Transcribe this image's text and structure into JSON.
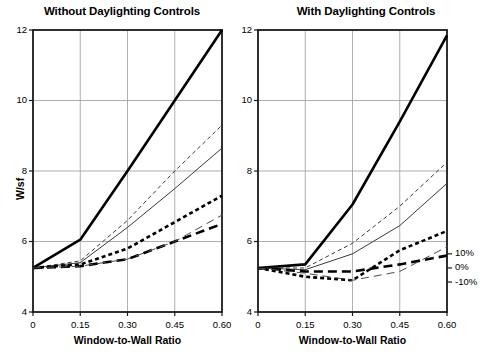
{
  "chart_data": [
    {
      "type": "line",
      "title": "Without Daylighting Controls",
      "xlabel": "Window-to-Wall Ratio",
      "ylabel": "W/sf",
      "xlim": [
        0,
        0.6
      ],
      "ylim": [
        4,
        12
      ],
      "xticks": [
        0,
        0.15,
        0.3,
        0.45,
        0.6
      ],
      "xticklabels": [
        "0",
        "0.15",
        "0.30",
        "0.45",
        "0.60"
      ],
      "yticks": [
        4,
        6,
        8,
        10,
        12
      ],
      "yticklabels": [
        "4",
        "6",
        "8",
        "10",
        "12"
      ],
      "grid": true,
      "legend": null,
      "x": [
        0,
        0.15,
        0.3,
        0.45,
        0.6
      ],
      "series": [
        {
          "name": "thick-solid",
          "style": "solid",
          "width": "thick",
          "color": "#000000",
          "values": [
            5.25,
            6.05,
            8.0,
            10.0,
            12.0
          ]
        },
        {
          "name": "thin-dashed-short",
          "style": "dashed-fine",
          "width": "thin",
          "color": "#3a3a3a",
          "values": [
            5.25,
            5.45,
            6.6,
            8.0,
            9.3
          ]
        },
        {
          "name": "thin-solid",
          "style": "solid",
          "width": "thin",
          "color": "#3a3a3a",
          "values": [
            5.25,
            5.4,
            6.4,
            7.5,
            8.65
          ]
        },
        {
          "name": "thick-dotted",
          "style": "dotted",
          "width": "thick",
          "color": "#000000",
          "values": [
            5.25,
            5.35,
            5.8,
            6.55,
            7.3
          ]
        },
        {
          "name": "thick-dashed-long",
          "style": "dashed-long",
          "width": "thick",
          "color": "#000000",
          "values": [
            5.25,
            5.3,
            5.5,
            6.0,
            6.5
          ]
        },
        {
          "name": "thin-dashed-long",
          "style": "dashed-long",
          "width": "thin",
          "color": "#4a4a4a",
          "values": [
            5.25,
            5.3,
            5.5,
            6.0,
            6.75
          ]
        }
      ]
    },
    {
      "type": "line",
      "title": "With Daylighting Controls",
      "xlabel": "Window-to-Wall Ratio",
      "ylabel": "",
      "xlim": [
        0,
        0.6
      ],
      "ylim": [
        4,
        12
      ],
      "xticks": [
        0,
        0.15,
        0.3,
        0.45,
        0.6
      ],
      "xticklabels": [
        "0",
        "0.15",
        "0.30",
        "0.45",
        "0.60"
      ],
      "yticks": [
        4,
        6,
        8,
        10,
        12
      ],
      "yticklabels": [
        "4",
        "6",
        "8",
        "10",
        "12"
      ],
      "grid": true,
      "legend": {
        "position": "right",
        "entries": [
          {
            "label": "10%",
            "value": 5.65
          },
          {
            "label": "0%",
            "value": 5.25
          },
          {
            "label": "-10%",
            "value": 4.85
          }
        ]
      },
      "x": [
        0,
        0.15,
        0.3,
        0.45,
        0.6
      ],
      "series": [
        {
          "name": "thick-solid",
          "style": "solid",
          "width": "thick",
          "color": "#000000",
          "values": [
            5.25,
            5.35,
            7.05,
            9.4,
            11.85
          ]
        },
        {
          "name": "thin-dashed-short",
          "style": "dashed-fine",
          "width": "thin",
          "color": "#3a3a3a",
          "values": [
            5.25,
            5.25,
            5.95,
            7.0,
            8.25
          ]
        },
        {
          "name": "thin-solid",
          "style": "solid",
          "width": "thin",
          "color": "#3a3a3a",
          "values": [
            5.25,
            5.2,
            5.65,
            6.45,
            7.65
          ]
        },
        {
          "name": "thick-dotted",
          "style": "dotted",
          "width": "thick",
          "color": "#000000",
          "values": [
            5.25,
            5.0,
            4.9,
            5.75,
            6.3
          ]
        },
        {
          "name": "thick-dashed-long",
          "style": "dashed-long",
          "width": "thick",
          "color": "#000000",
          "values": [
            5.25,
            5.15,
            5.15,
            5.35,
            5.6
          ]
        },
        {
          "name": "thin-dashed-long",
          "style": "dashed-long",
          "width": "thin",
          "color": "#4a4a4a",
          "values": [
            5.25,
            5.1,
            4.9,
            5.15,
            5.85
          ]
        }
      ]
    }
  ]
}
